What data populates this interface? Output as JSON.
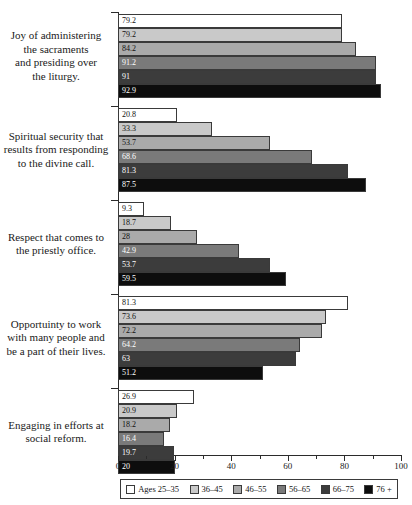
{
  "chart_data": {
    "type": "bar",
    "orientation": "horizontal",
    "title": "",
    "subtitle": "",
    "xlabel": "",
    "ylabel": "",
    "xlim": [
      0,
      100
    ],
    "xticks": [
      0,
      20,
      40,
      60,
      80,
      100
    ],
    "xtick_labels": [
      "0",
      "20",
      "40",
      "60",
      "80",
      "100"
    ],
    "grid": false,
    "legend_position": "bottom",
    "categories": [
      "Joy of administering the sacraments and presiding over the liturgy.",
      "Spiritual security that results from responding to the divine call.",
      "Respect that comes to the priestly office.",
      "Opportuinty to work with many people and be a part of their lives.",
      "Engaging in efforts at social reform."
    ],
    "category_lines": [
      [
        "Joy of administering",
        "the sacraments",
        "and presiding over",
        "the liturgy."
      ],
      [
        "Spiritual security that",
        "results from responding",
        "to the divine call."
      ],
      [
        "Respect that comes to",
        "the priestly office."
      ],
      [
        "Opportuinty to work",
        "with many people and",
        "be a part of their lives."
      ],
      [
        "Engaging in efforts at",
        "social reform."
      ]
    ],
    "series": [
      {
        "name": "Ages 25–35",
        "color": "#ffffff",
        "label_color": "dark",
        "values": [
          79.2,
          20.8,
          9.3,
          81.3,
          26.9
        ]
      },
      {
        "name": "36–45",
        "color": "#c9c9c9",
        "label_color": "dark",
        "values": [
          79.2,
          33.3,
          18.7,
          73.6,
          20.9
        ]
      },
      {
        "name": "46–55",
        "color": "#aaaaaa",
        "label_color": "dark",
        "values": [
          84.2,
          53.7,
          28,
          72.2,
          18.2
        ]
      },
      {
        "name": "56–65",
        "color": "#7a7a7a",
        "label_color": "light",
        "values": [
          91.2,
          68.6,
          42.9,
          64.2,
          16.4
        ]
      },
      {
        "name": "66–75",
        "color": "#3c3c3c",
        "label_color": "light",
        "values": [
          91,
          81.3,
          53.7,
          63,
          19.7
        ]
      },
      {
        "name": "76 +",
        "color": "#0d0d0d",
        "label_color": "light",
        "values": [
          92.9,
          87.5,
          59.5,
          51.2,
          20
        ]
      }
    ]
  },
  "legend": {
    "entries": [
      {
        "label": "Ages 25–35",
        "color": "#ffffff"
      },
      {
        "label": "36–45",
        "color": "#c9c9c9"
      },
      {
        "label": "46–55",
        "color": "#aaaaaa"
      },
      {
        "label": "56–65",
        "color": "#7a7a7a"
      },
      {
        "label": "66–75",
        "color": "#3c3c3c"
      },
      {
        "label": "76 +",
        "color": "#0d0d0d"
      }
    ]
  }
}
